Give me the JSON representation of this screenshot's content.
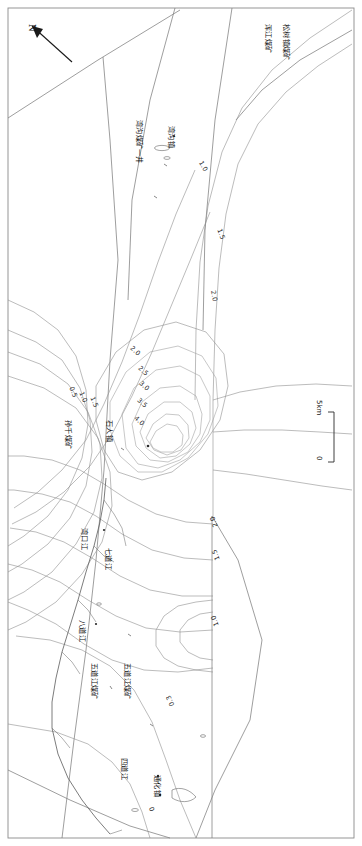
{
  "figure": {
    "type": "contour-map",
    "orientation_note": "rotated-90",
    "north_arrow_label": "N",
    "scale_bar": {
      "max_label": "5km",
      "min_label": "0",
      "unit": "km"
    }
  },
  "chart_data": {
    "type": "heatmap",
    "title": "",
    "xlabel": "",
    "ylabel": "",
    "contour_unit": "",
    "contour_levels": [
      0.3,
      0.5,
      1.0,
      1.5,
      2.0,
      2.5,
      3.0,
      3.5,
      4.0
    ],
    "peak_value": 4.0,
    "legend_position": "none",
    "grid": false,
    "contour_labels": [
      {
        "id": "c-1-0-ur",
        "value": "1.0",
        "x": 203,
        "y": 160,
        "rot": 60
      },
      {
        "id": "c-1-5-ur",
        "value": "1.5",
        "x": 222,
        "y": 228,
        "rot": 70
      },
      {
        "id": "c-2-0-ur",
        "value": "2.0",
        "x": 216,
        "y": 290,
        "rot": 80
      },
      {
        "id": "c-2-0-mid",
        "value": "2.0",
        "x": 133,
        "y": 345,
        "rot": 42
      },
      {
        "id": "c-2-5-mid",
        "value": "2.5",
        "x": 141,
        "y": 365,
        "rot": 42
      },
      {
        "id": "c-3-0-mid",
        "value": "3.0",
        "x": 142,
        "y": 380,
        "rot": 42
      },
      {
        "id": "c-3-5-mid",
        "value": "3.5",
        "x": 140,
        "y": 397,
        "rot": 42
      },
      {
        "id": "c-4-0-mid",
        "value": "4.0",
        "x": 137,
        "y": 415,
        "rot": 42
      },
      {
        "id": "c-0-5-l",
        "value": "0.5",
        "x": 74,
        "y": 386,
        "rot": 68
      },
      {
        "id": "c-1-0-l",
        "value": "1.0",
        "x": 84,
        "y": 391,
        "rot": 68
      },
      {
        "id": "c-1-5-l",
        "value": "1.5",
        "x": 95,
        "y": 396,
        "rot": 68
      },
      {
        "id": "c-2-0-lr",
        "value": "2.0",
        "x": 213,
        "y": 528,
        "rot": 250
      },
      {
        "id": "c-1-5-lr",
        "value": "1.5",
        "x": 215,
        "y": 561,
        "rot": 250
      },
      {
        "id": "c-1-0-lr",
        "value": "1.0",
        "x": 214,
        "y": 627,
        "rot": 250
      },
      {
        "id": "c-0-3-lb",
        "value": "0.3",
        "x": 170,
        "y": 707,
        "rot": 245
      },
      {
        "id": "c-0-b",
        "value": "0",
        "x": 150,
        "y": 812,
        "rot": 250
      }
    ]
  },
  "place_labels": [
    {
      "id": "p-hunjiang",
      "text": "浑江煤矿",
      "x": 272,
      "y": 24,
      "rot": 90
    },
    {
      "id": "p-songshu",
      "text": "松树镇煤矿",
      "x": 290,
      "y": 24,
      "rot": 90
    },
    {
      "id": "p-wantanmei",
      "text": "湾沟煤矿一井",
      "x": 143,
      "y": 120,
      "rot": 90
    },
    {
      "id": "p-wangou",
      "text": "湾沟镇",
      "x": 175,
      "y": 126,
      "rot": 90
    },
    {
      "id": "p-sunjiabao",
      "text": "孙千煤矿",
      "x": 72,
      "y": 420,
      "rot": 90
    },
    {
      "id": "p-shiren",
      "text": "石人镇",
      "x": 113,
      "y": 420,
      "rot": 90
    },
    {
      "id": "p-wanlikou",
      "text": "湾口江",
      "x": 88,
      "y": 528,
      "rot": 90
    },
    {
      "id": "p-qidaojiang",
      "text": "七道江",
      "x": 112,
      "y": 548,
      "rot": 90
    },
    {
      "id": "p-badaojiang",
      "text": "八道江",
      "x": 86,
      "y": 620,
      "rot": 90
    },
    {
      "id": "p-wudaojiang",
      "text": "五道江煤矿",
      "x": 98,
      "y": 663,
      "rot": 90
    },
    {
      "id": "p-wudaojiang2",
      "text": "五道江煤矿",
      "x": 131,
      "y": 663,
      "rot": 90
    },
    {
      "id": "p-sidaojiang",
      "text": "四道江",
      "x": 128,
      "y": 758,
      "rot": 90
    },
    {
      "id": "p-tonghua",
      "text": "通化镇",
      "x": 161,
      "y": 775,
      "rot": 90
    }
  ]
}
